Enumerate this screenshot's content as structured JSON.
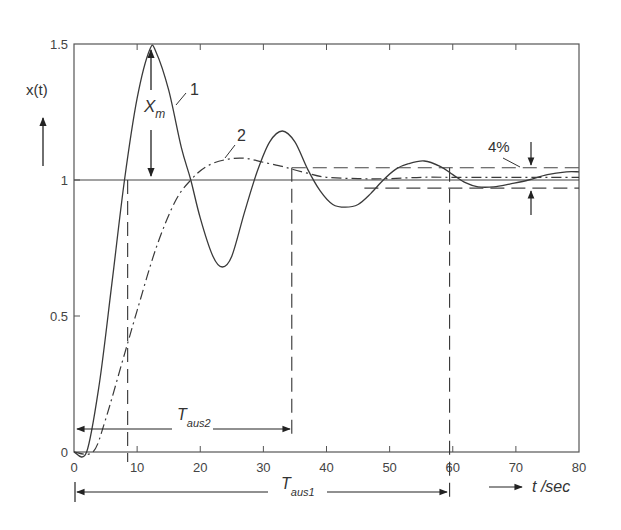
{
  "chart_data": {
    "type": "line",
    "title": "",
    "xlabel": "t /sec",
    "ylabel": "x(t)",
    "xlim": [
      0,
      80
    ],
    "ylim": [
      0,
      1.5
    ],
    "x_ticks": [
      0,
      10,
      20,
      30,
      40,
      50,
      60,
      70,
      80
    ],
    "x_tick_labels": [
      "0",
      "10",
      "20",
      "30",
      "40",
      "50",
      "60",
      "70",
      "80"
    ],
    "y_ticks": [
      0,
      0.5,
      1,
      1.5
    ],
    "y_tick_labels": [
      "0",
      "0.5",
      "1",
      "1.5"
    ],
    "grid": false,
    "legend": "none (curves labeled inline)",
    "reference_line": {
      "y": 1,
      "style": "solid"
    },
    "tolerance_band": {
      "label": "4%",
      "upper": 1.045,
      "lower": 0.97,
      "style": "dashed"
    },
    "series": [
      {
        "name": "1",
        "style": "solid",
        "x": [
          0,
          2,
          4,
          6,
          8,
          10,
          12,
          13,
          15,
          17,
          18.5,
          20,
          22,
          23.5,
          25,
          27,
          29,
          31,
          33,
          35,
          37,
          39,
          41,
          43,
          45,
          47,
          49,
          51,
          53,
          55.5,
          58,
          60,
          62,
          64,
          66.5,
          69,
          72,
          75,
          78,
          80
        ],
        "y": [
          0,
          0,
          0.25,
          0.62,
          1.0,
          1.3,
          1.48,
          1.47,
          1.33,
          1.12,
          1.0,
          0.86,
          0.72,
          0.68,
          0.72,
          0.88,
          1.03,
          1.14,
          1.18,
          1.14,
          1.04,
          0.96,
          0.91,
          0.9,
          0.91,
          0.95,
          1.0,
          1.04,
          1.06,
          1.07,
          1.05,
          1.02,
          0.99,
          0.975,
          0.975,
          0.985,
          1.0,
          1.02,
          1.03,
          1.03
        ]
      },
      {
        "name": "2",
        "style": "dash-dot",
        "x": [
          0,
          3,
          5,
          8,
          10,
          13,
          16,
          18.5,
          21,
          24,
          27,
          30,
          33,
          34.5,
          37,
          40,
          45,
          50,
          55,
          60,
          65,
          70,
          75,
          80
        ],
        "y": [
          0,
          0,
          0.12,
          0.36,
          0.52,
          0.75,
          0.92,
          1.0,
          1.05,
          1.075,
          1.08,
          1.065,
          1.05,
          1.04,
          1.025,
          1.01,
          1.005,
          1.005,
          1.01,
          1.01,
          1.01,
          1.01,
          1.01,
          1.01
        ]
      }
    ],
    "annotations": [
      {
        "text": "X",
        "subscript": "m",
        "meaning": "overshoot of curve 1 from 1 to peak ~1.48 at t~12"
      },
      {
        "text": "1",
        "at": [
          16.5,
          1.38
        ]
      },
      {
        "text": "2",
        "at": [
          25.5,
          1.15
        ]
      },
      {
        "text": "4%",
        "at": [
          66,
          1.4
        ]
      },
      {
        "text": "T",
        "subscript": "aus2",
        "span": [
          0,
          34.5
        ]
      },
      {
        "text": "T",
        "subscript": "aus1",
        "span": [
          0,
          59.5
        ]
      }
    ],
    "vertical_markers": [
      8.5,
      34.5,
      59.5
    ]
  },
  "labels": {
    "y_axis": "x(t)",
    "x_axis": "t /sec",
    "xm_main": "X",
    "xm_sub": "m",
    "curve1": "1",
    "curve2": "2",
    "band": "4%",
    "taus2_main": "T",
    "taus2_sub": "aus2",
    "taus1_main": "T",
    "taus1_sub": "aus1"
  },
  "colors": {
    "line": "#3a3a3a",
    "text": "#333333",
    "axis": "#555555"
  }
}
